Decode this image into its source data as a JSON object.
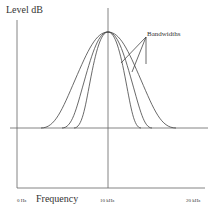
{
  "diagram": {
    "y_axis_label": "Level dB",
    "x_axis_label": "Frequency",
    "annotation": "Bandwidths",
    "x_ticks": [
      "0 Hz",
      "10 kHz",
      "20 kHz"
    ],
    "center_frequency": "10 kHz",
    "curves": [
      {
        "name": "wide",
        "base_left": 41,
        "base_right": 176
      },
      {
        "name": "medium",
        "base_left": 62,
        "base_right": 152
      },
      {
        "name": "narrow",
        "base_left": 74,
        "base_right": 141
      }
    ],
    "line_color": "#555555"
  }
}
